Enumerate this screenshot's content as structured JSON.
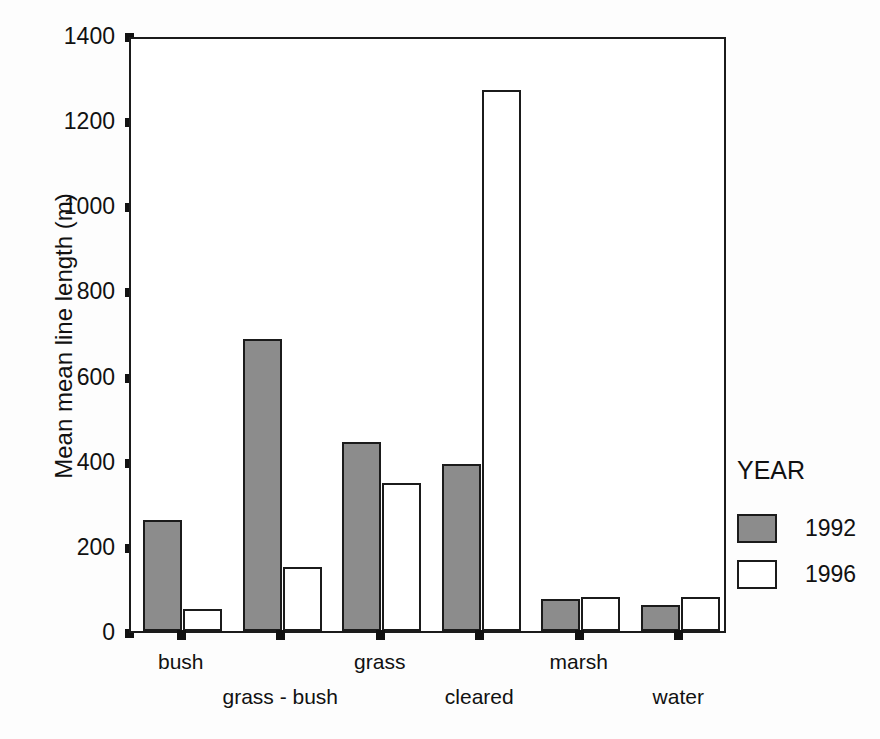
{
  "chart_data": {
    "type": "bar",
    "title": "",
    "subtitle": "",
    "xlabel": "",
    "ylabel": "Mean mean line length (m)",
    "categories": [
      "bush",
      "grass - bush",
      "grass",
      "cleared",
      "marsh",
      "water"
    ],
    "series": [
      {
        "name": "1992",
        "color": "#8c8c8c",
        "values": [
          260,
          685,
          445,
          393,
          75,
          62
        ]
      },
      {
        "name": "1996",
        "color": "#ffffff",
        "values": [
          52,
          150,
          347,
          1270,
          80,
          80
        ]
      }
    ],
    "ylim": [
      0,
      1400
    ],
    "yticks": [
      0,
      200,
      400,
      600,
      800,
      1000,
      1200,
      1400
    ],
    "ytick_labels": [
      "0",
      "200",
      "400",
      "600",
      "800",
      "1000",
      "1200",
      "1400"
    ],
    "grid": false,
    "legend": {
      "title": "YEAR",
      "position": "right",
      "entries": [
        {
          "label": "1992",
          "swatch": "gray-filled-square"
        },
        {
          "label": "1996",
          "swatch": "white-open-square"
        }
      ]
    },
    "axis_colors": {
      "frame": "#1b1b1b",
      "bar_edge": "#1b1b1b",
      "text": "#111111"
    }
  }
}
